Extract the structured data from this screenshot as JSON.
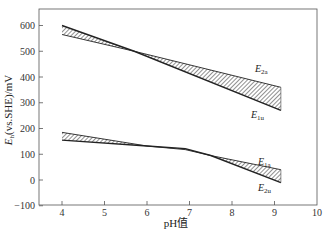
{
  "chart_data": {
    "type": "line",
    "title": "",
    "xlabel": "pH值",
    "ylabel": "E_h(vs.SHE)/mV",
    "xlim": [
      3.5,
      10
    ],
    "ylim": [
      -100,
      650
    ],
    "x_ticks": [
      "4",
      "5",
      "6",
      "7",
      "8",
      "9",
      "10"
    ],
    "y_ticks": [
      "-100",
      "0",
      "100",
      "200",
      "300",
      "400",
      "500",
      "600"
    ],
    "grid": false,
    "legend": "inline labels at right end of lines",
    "series": [
      {
        "name": "E2a",
        "label_main": "E",
        "label_sub": "2a",
        "x": [
          4.0,
          5.7,
          9.15
        ],
        "y": [
          565,
          500,
          360
        ]
      },
      {
        "name": "E1u",
        "label_main": "E",
        "label_sub": "1u",
        "x": [
          4.0,
          5.7,
          9.15
        ],
        "y": [
          600,
          500,
          270
        ]
      },
      {
        "name": "E1a",
        "label_main": "E",
        "label_sub": "1a",
        "x": [
          4.0,
          6.0,
          6.9,
          7.5,
          9.15
        ],
        "y": [
          185,
          132,
          118,
          95,
          40
        ]
      },
      {
        "name": "E2u",
        "label_main": "E",
        "label_sub": "2u",
        "x": [
          4.0,
          6.0,
          6.9,
          7.5,
          9.15
        ],
        "y": [
          155,
          132,
          122,
          95,
          -10
        ]
      }
    ],
    "annotations": "hatched regions between E2a/E1u and between E1a/E2u"
  },
  "axis": {
    "ylabel_main": "E",
    "ylabel_sub": "h",
    "ylabel_rest": "(vs.SHE)/mV",
    "xlabel": "pH值"
  }
}
